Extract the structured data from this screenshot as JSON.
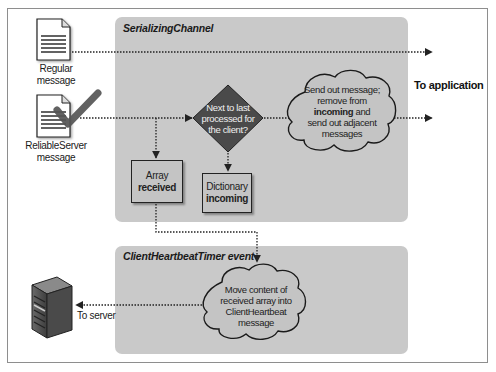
{
  "panels": {
    "serializing": {
      "title": "SerializingChannel"
    },
    "heartbeat": {
      "title": "ClientHeartbeatTimer event"
    }
  },
  "inputs": {
    "regular": {
      "label": "Regular message",
      "icon": "document-icon"
    },
    "reliable": {
      "label_line1": "ReliableServer",
      "label_line2": "message",
      "icon": "document-checked-icon"
    }
  },
  "decision": {
    "line1": "Next to last",
    "line2": "processed for",
    "line3": "the client?"
  },
  "boxes": {
    "array": {
      "line1": "Array",
      "line2": "received"
    },
    "dictionary": {
      "line1": "Dictionary",
      "line2": "incoming"
    }
  },
  "clouds": {
    "send": {
      "line1": "Send out message;",
      "line2": "remove from",
      "line3_bold": "incoming",
      "line3_rest": " and",
      "line4": "send out adjacent",
      "line5": "messages"
    },
    "move": {
      "line1": "Move content of",
      "line2": "received array into",
      "line3": "ClientHeartbeat",
      "line4": "message"
    }
  },
  "outputs": {
    "application": "To application",
    "server": "To server"
  },
  "colors": {
    "panel": "#c9c9c9",
    "diamond": "#4a4a4a",
    "check": "#555555",
    "arrow": "#222222"
  }
}
